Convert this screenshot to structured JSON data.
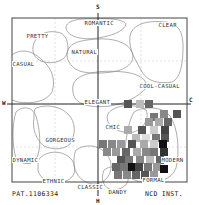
{
  "diagram": {
    "type": "image-scale",
    "axes": {
      "top": "S",
      "bottom": "H",
      "left": "W",
      "right": "C"
    },
    "regions": [
      {
        "label": "ROMANTIC",
        "x": 84,
        "y": 20
      },
      {
        "label": "CLEAR",
        "x": 158,
        "y": 22
      },
      {
        "label": "PRETTY",
        "x": 26,
        "y": 33
      },
      {
        "label": "NATURAL",
        "x": 71,
        "y": 49
      },
      {
        "label": "CASUAL",
        "x": 12,
        "y": 61
      },
      {
        "label": "COOL-CASUAL",
        "x": 139,
        "y": 83
      },
      {
        "label": "ELEGANT",
        "x": 84,
        "y": 99
      },
      {
        "label": "CHIC",
        "x": 105,
        "y": 124
      },
      {
        "label": "GORGEOUS",
        "x": 45,
        "y": 137
      },
      {
        "label": "MODERN",
        "x": 161,
        "y": 157
      },
      {
        "label": "DYNAMIC",
        "x": 12,
        "y": 157
      },
      {
        "label": "ETHNIC",
        "x": 42,
        "y": 178
      },
      {
        "label": "FORMAL",
        "x": 142,
        "y": 177
      },
      {
        "label": "CLASSIC",
        "x": 77,
        "y": 184
      },
      {
        "label": "DANDY",
        "x": 108,
        "y": 189
      }
    ],
    "mosaic_cells": [
      {
        "x": 124,
        "y": 100,
        "g": "#555555"
      },
      {
        "x": 136,
        "y": 100,
        "g": "#bbbbbb"
      },
      {
        "x": 145,
        "y": 100,
        "g": "#666666"
      },
      {
        "x": 150,
        "y": 113,
        "g": "#777777"
      },
      {
        "x": 160,
        "y": 110,
        "g": "#888888"
      },
      {
        "x": 173,
        "y": 110,
        "g": "#555555"
      },
      {
        "x": 145,
        "y": 118,
        "g": "#999999"
      },
      {
        "x": 155,
        "y": 118,
        "g": "#aaaaaa"
      },
      {
        "x": 164,
        "y": 118,
        "g": "#666666"
      },
      {
        "x": 124,
        "y": 126,
        "g": "#aaaaaa"
      },
      {
        "x": 138,
        "y": 126,
        "g": "#555555"
      },
      {
        "x": 150,
        "y": 126,
        "g": "#cccccc"
      },
      {
        "x": 161,
        "y": 126,
        "g": "#444444"
      },
      {
        "x": 132,
        "y": 134,
        "g": "#bbbbbb"
      },
      {
        "x": 142,
        "y": 134,
        "g": "#dddddd"
      },
      {
        "x": 152,
        "y": 134,
        "g": "#777777"
      },
      {
        "x": 161,
        "y": 134,
        "g": "#555555"
      },
      {
        "x": 99,
        "y": 140,
        "g": "#777777"
      },
      {
        "x": 108,
        "y": 140,
        "g": "#888888"
      },
      {
        "x": 117,
        "y": 140,
        "g": "#999999"
      },
      {
        "x": 128,
        "y": 140,
        "g": "#555555"
      },
      {
        "x": 140,
        "y": 140,
        "g": "#aaaaaa"
      },
      {
        "x": 150,
        "y": 140,
        "g": "#cccccc"
      },
      {
        "x": 159,
        "y": 140,
        "g": "#111111"
      },
      {
        "x": 103,
        "y": 148,
        "g": "#888888"
      },
      {
        "x": 112,
        "y": 148,
        "g": "#999999"
      },
      {
        "x": 122,
        "y": 148,
        "g": "#666666"
      },
      {
        "x": 133,
        "y": 148,
        "g": "#aaaaaa"
      },
      {
        "x": 142,
        "y": 148,
        "g": "#888888"
      },
      {
        "x": 150,
        "y": 148,
        "g": "#777777"
      },
      {
        "x": 160,
        "y": 148,
        "g": "#333333"
      },
      {
        "x": 117,
        "y": 156,
        "g": "#555555"
      },
      {
        "x": 125,
        "y": 156,
        "g": "#777777"
      },
      {
        "x": 136,
        "y": 156,
        "g": "#888888"
      },
      {
        "x": 146,
        "y": 156,
        "g": "#bbbbbb"
      },
      {
        "x": 156,
        "y": 156,
        "g": "#666666"
      },
      {
        "x": 112,
        "y": 163,
        "g": "#666666"
      },
      {
        "x": 120,
        "y": 163,
        "g": "#777777"
      },
      {
        "x": 128,
        "y": 163,
        "g": "#111111"
      },
      {
        "x": 135,
        "y": 163,
        "g": "#444444"
      },
      {
        "x": 144,
        "y": 163,
        "g": "#777777"
      },
      {
        "x": 153,
        "y": 163,
        "g": "#999999"
      },
      {
        "x": 114,
        "y": 171,
        "g": "#777777"
      },
      {
        "x": 123,
        "y": 171,
        "g": "#888888"
      },
      {
        "x": 132,
        "y": 171,
        "g": "#666666"
      },
      {
        "x": 141,
        "y": 171,
        "g": "#555555"
      },
      {
        "x": 150,
        "y": 171,
        "g": "#999999"
      },
      {
        "x": 160,
        "y": 165,
        "g": "#111111"
      }
    ]
  },
  "footer": {
    "left": "PAT.1106334",
    "right": "NCD INST."
  }
}
